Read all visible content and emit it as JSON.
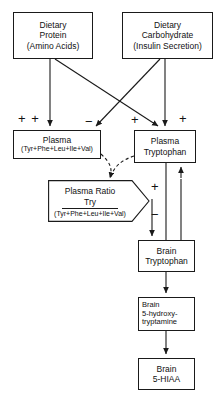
{
  "diagram": {
    "type": "flowchart",
    "colors": {
      "stroke": "#1a1a1a",
      "background": "#ffffff",
      "text": "#111111"
    },
    "nodes": [
      {
        "id": "dietary-protein",
        "shape": "rectangle",
        "lines": [
          "Dietary",
          "Protein",
          "(Amino Acids)"
        ]
      },
      {
        "id": "dietary-carbohydrate",
        "shape": "rectangle",
        "lines": [
          "Dietary",
          "Carbohydrate",
          "(Insulin Secretion)"
        ]
      },
      {
        "id": "plasma-large-neutral-amino-acids",
        "shape": "rectangle",
        "lines": [
          "Plasma",
          "(Tyr+Phe+Leu+Ile+Val)"
        ]
      },
      {
        "id": "plasma-tryptophan",
        "shape": "rectangle",
        "lines": [
          "Plasma",
          "Tryptophan"
        ]
      },
      {
        "id": "plasma-ratio",
        "shape": "pentagon-arrow",
        "lines": [
          "Plasma Ratio",
          "Try",
          "(Tyr+Phe+Leu+Ile+Val)"
        ]
      },
      {
        "id": "brain-tryptophan",
        "shape": "rectangle",
        "lines": [
          "Brain",
          "Tryptophan"
        ]
      },
      {
        "id": "brain-5-hydroxytryptamine",
        "shape": "rectangle",
        "lines": [
          "Brain",
          "5-hydroxy-",
          "tryptamine"
        ]
      },
      {
        "id": "brain-5-hiaa",
        "shape": "rectangle",
        "lines": [
          "Brain",
          "5-HIAA"
        ]
      }
    ],
    "signs": [
      {
        "id": "plus-plus-plasma-laa",
        "label": "+ +"
      },
      {
        "id": "minus-to-plasma-laa",
        "label": "−"
      },
      {
        "id": "plus-to-plasma-trp-left",
        "label": "+"
      },
      {
        "id": "plus-to-plasma-trp-right",
        "label": "+"
      },
      {
        "id": "plus-ratio-output",
        "label": "+"
      },
      {
        "id": "minus-ratio-output",
        "label": "−"
      }
    ]
  },
  "nodes": {
    "dietary_protein": {
      "line1": "Dietary",
      "line2": "Protein",
      "line3": "(Amino Acids)"
    },
    "dietary_carbohydrate": {
      "line1": "Dietary",
      "line2": "Carbohydrate",
      "line3": "(Insulin Secretion)"
    },
    "plasma_laa": {
      "line1": "Plasma",
      "line2": "(Tyr+Phe+Leu+Ile+Val)"
    },
    "plasma_tryptophan": {
      "line1": "Plasma",
      "line2": "Tryptophan"
    },
    "plasma_ratio": {
      "line1": "Plasma  Ratio",
      "numerator": "Try",
      "denominator": "(Tyr+Phe+Leu+Ile+Val)"
    },
    "brain_tryptophan": {
      "line1": "Brain",
      "line2": "Tryptophan"
    },
    "brain_5ht": {
      "line1": "Brain",
      "line2": "5-hydroxy-",
      "line3": "tryptamine"
    },
    "brain_5hiaa": {
      "line1": "Brain",
      "line2": "5-HIAA"
    }
  },
  "signs": {
    "plus_plus": "+ +",
    "minus_laa": "−",
    "plus_trp_left": "+",
    "plus_trp_right": "+",
    "plus_ratio": "+",
    "minus_ratio": "−"
  }
}
